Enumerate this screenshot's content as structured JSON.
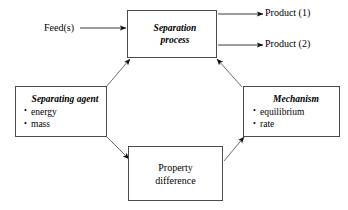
{
  "diagram": {
    "background": "#ffffff",
    "line_color": "#4a4a4a",
    "text_color": "#000000"
  },
  "nodes": {
    "separation_process": {
      "name": "Separation process",
      "line1": "Separation",
      "line2": "process",
      "style": "italic-bold"
    },
    "separating_agent": {
      "name": "Separating agent",
      "title": "Separating agent",
      "style": "italic-bold",
      "bullets": [
        "energy",
        "mass"
      ]
    },
    "mechanism": {
      "name": "Mechanism",
      "title": "Mechanism",
      "style": "italic-bold",
      "bullets": [
        "equilibrium",
        "rate"
      ]
    },
    "property_difference": {
      "name": "Property difference",
      "line1": "Property",
      "line2": "difference",
      "style": "plain"
    }
  },
  "io": {
    "feed": "Feed(s)",
    "product_1": "Product (1)",
    "product_2": "Product (2)"
  },
  "edges": [
    {
      "id": "feed-to-separation",
      "from": "Feed(s)",
      "to": "Separation process",
      "kind": "arrow-right"
    },
    {
      "id": "separation-to-product-1",
      "from": "Separation process",
      "to": "Product (1)",
      "kind": "arrow-right"
    },
    {
      "id": "separation-to-product-2",
      "from": "Separation process",
      "to": "Product (2)",
      "kind": "arrow-right"
    },
    {
      "id": "separating-agent-to-separation",
      "from": "Separating agent",
      "to": "Separation process",
      "kind": "arrow-diagonal"
    },
    {
      "id": "separating-agent-to-property-difference",
      "from": "Separating agent",
      "to": "Property difference",
      "kind": "arrow-diagonal"
    },
    {
      "id": "property-difference-to-mechanism",
      "from": "Property difference",
      "to": "Mechanism",
      "kind": "arrow-diagonal"
    },
    {
      "id": "mechanism-to-separation",
      "from": "Mechanism",
      "to": "Separation process",
      "kind": "arrow-diagonal"
    }
  ]
}
